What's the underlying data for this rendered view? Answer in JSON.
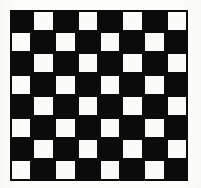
{
  "image": {
    "title": "Checkerboard pattern",
    "description": "8 by 8 alternating black and white checkerboard",
    "background_color": "#fdfdfc"
  },
  "chart_data": {
    "type": "heatmap",
    "rows": 8,
    "columns": 8,
    "xlabel": "",
    "ylabel": "",
    "grid": true,
    "legend": "none",
    "colors": {
      "dark": "#0b0b0b",
      "light": "#fbfbfa",
      "border": "#0b0b0b"
    },
    "top_left_cell": "dark",
    "values": [
      [
        0,
        1,
        0,
        1,
        0,
        1,
        0,
        1
      ],
      [
        1,
        0,
        1,
        0,
        1,
        0,
        1,
        0
      ],
      [
        0,
        1,
        0,
        1,
        0,
        1,
        0,
        1
      ],
      [
        1,
        0,
        1,
        0,
        1,
        0,
        1,
        0
      ],
      [
        0,
        1,
        0,
        1,
        0,
        1,
        0,
        1
      ],
      [
        1,
        0,
        1,
        0,
        1,
        0,
        1,
        0
      ],
      [
        0,
        1,
        0,
        1,
        0,
        1,
        0,
        1
      ],
      [
        1,
        0,
        1,
        0,
        1,
        0,
        1,
        0
      ]
    ],
    "value_labels": {
      "0": "dark",
      "1": "light"
    }
  },
  "geometry": {
    "board_left": 10,
    "board_top": 10,
    "board_width": 178,
    "board_height": 171
  }
}
